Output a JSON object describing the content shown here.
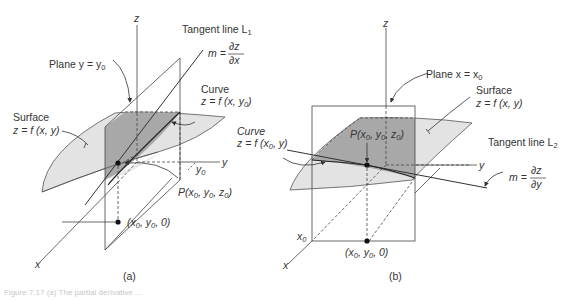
{
  "panel_a": {
    "label": "(a)",
    "axis_z": "z",
    "axis_y": "y",
    "axis_x": "x",
    "tick_y0": "y",
    "tick_y0_sub": "0",
    "tangent_title": "Tangent line L",
    "tangent_sub": "1",
    "slope_m": "m =",
    "slope_num": "∂z",
    "slope_den": "∂x",
    "plane_label": "Plane y = y",
    "plane_sub": "0",
    "curve_title": "Curve",
    "curve_eq": "z = f (x, y",
    "curve_eq_sub": "0",
    "curve_eq_end": ")",
    "surface_title": "Surface",
    "surface_eq": "z = f (x, y)",
    "point_P": "P(x",
    "point_P_rest": ", y",
    "point_P_rest2": ", z",
    "point_base": "(x",
    "point_base_rest": ", y",
    "point_base_end": ", 0)"
  },
  "panel_b": {
    "label": "(b)",
    "axis_z": "z",
    "axis_y": "y",
    "axis_x": "x",
    "tick_x0": "x",
    "tick_x0_sub": "0",
    "plane_label": "Plane x = x",
    "plane_sub": "0",
    "surface_title": "Surface",
    "surface_eq": "z = f (x, y)",
    "curve_title": "Curve",
    "curve_eq": "z = f (x",
    "curve_eq_sub": "0",
    "curve_eq_end": ", y)",
    "point_P": "P(x",
    "tangent_title": "Tangent line L",
    "tangent_sub": "2",
    "slope_m": "m =",
    "slope_num": "∂z",
    "slope_den": "∂y",
    "point_base": "(x"
  },
  "caption": "Figure 7.17  (a) The partial derivative ...",
  "colors": {
    "surface_light": "#e2e2e2",
    "surface_dark": "#a9a9a9",
    "line": "#3a3a3a",
    "point": "#111111"
  }
}
